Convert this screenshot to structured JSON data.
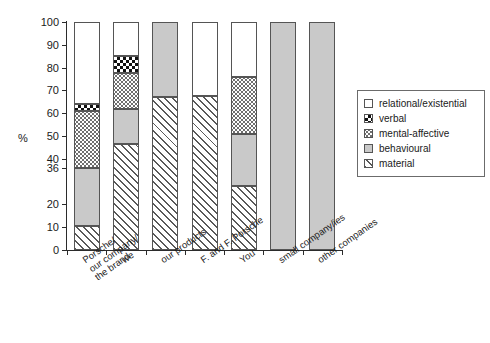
{
  "chart_data": {
    "type": "bar",
    "subtype": "stacked-100-percent",
    "title": "",
    "subtitle": "",
    "xlabel": "",
    "ylabel": "%",
    "ylim": [
      0,
      100
    ],
    "yticks": [
      0,
      10,
      20,
      36,
      40,
      50,
      60,
      70,
      80,
      90,
      100
    ],
    "ytick_labels": [
      "0",
      "10",
      "20",
      "36",
      "40",
      "50",
      "60",
      "70",
      "80",
      "90",
      "100"
    ],
    "grid": false,
    "legend_position": "right",
    "categories": [
      "Porsche/\nour company/\nthe brand",
      "we",
      "our products",
      "F. and F. Porsche",
      "You",
      "small company/ies",
      "other companies"
    ],
    "series": [
      {
        "name": "material",
        "pattern": "diagonal-hatch",
        "color": "#595959",
        "values": [
          10.5,
          46.5,
          67,
          67.5,
          28,
          0,
          0
        ]
      },
      {
        "name": "behavioural",
        "pattern": "solid-gray",
        "color": "#c9c9c9",
        "values": [
          25.5,
          15.5,
          33,
          0,
          23,
          100,
          100
        ]
      },
      {
        "name": "mental-affective",
        "pattern": "fine-dots",
        "color": "#6f6f6f",
        "values": [
          25,
          15.5,
          0,
          0,
          25,
          0,
          0
        ]
      },
      {
        "name": "verbal",
        "pattern": "checkerboard",
        "color": "#111111",
        "values": [
          3,
          7.5,
          0,
          0,
          0,
          0,
          0
        ]
      },
      {
        "name": "relational/existential",
        "pattern": "white",
        "color": "#ffffff",
        "values": [
          36,
          15,
          0,
          32.5,
          24,
          0,
          0
        ]
      }
    ],
    "stack_order_bottom_to_top": [
      "material",
      "behavioural",
      "mental-affective",
      "verbal",
      "relational/existential"
    ]
  },
  "axes": {
    "y_axis_title": "%",
    "y_ticks": [
      {
        "value": 100,
        "label": "100"
      },
      {
        "value": 90,
        "label": "90"
      },
      {
        "value": 80,
        "label": "80"
      },
      {
        "value": 70,
        "label": "70"
      },
      {
        "value": 60,
        "label": "60"
      },
      {
        "value": 50,
        "label": "50"
      },
      {
        "value": 40,
        "label": "40"
      },
      {
        "value": 36,
        "label": "36"
      },
      {
        "value": 20,
        "label": "20"
      },
      {
        "value": 10,
        "label": "10"
      },
      {
        "value": 0,
        "label": "0"
      }
    ],
    "x_categories": [
      {
        "lines": [
          "Porsche/",
          "our company/",
          "the brand"
        ]
      },
      {
        "lines": [
          "we"
        ]
      },
      {
        "lines": [
          "our products"
        ]
      },
      {
        "lines": [
          "F. and F. Porsche"
        ]
      },
      {
        "lines": [
          "You"
        ]
      },
      {
        "lines": [
          "small company/ies"
        ]
      },
      {
        "lines": [
          "other companies"
        ]
      }
    ]
  },
  "legend": {
    "items": [
      {
        "label": "relational/existential",
        "fill": "fill-relational"
      },
      {
        "label": "verbal",
        "fill": "fill-verbal"
      },
      {
        "label": "mental-affective",
        "fill": "fill-mental"
      },
      {
        "label": "behavioural",
        "fill": "fill-behavioural"
      },
      {
        "label": "material",
        "fill": "fill-material"
      }
    ]
  }
}
